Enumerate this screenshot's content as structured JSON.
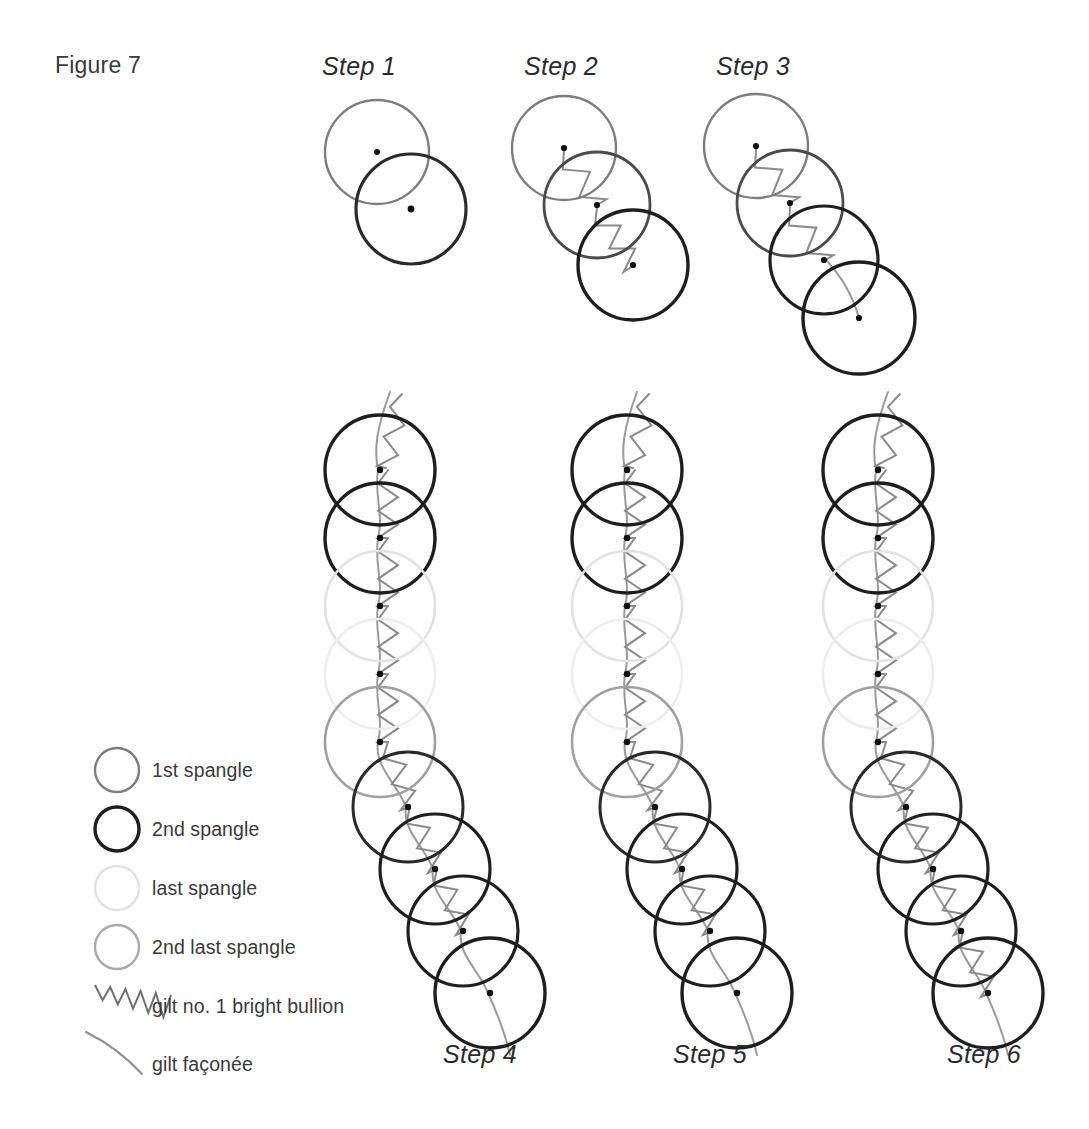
{
  "figure": {
    "title": "Figure 7",
    "title_x": 55,
    "title_y": 52
  },
  "palette": {
    "first_spangle": "#7d7d7d",
    "second_spangle": "#1e1e1e",
    "last_spangle": "#e2e2e2",
    "second_last_spangle": "#a9a9a9",
    "bullion_thread": "#8a8a8a",
    "faconee_thread": "#9a9a9a",
    "center_dot": "#111111",
    "text": "#3a3a3a",
    "background": "#ffffff"
  },
  "steps": [
    {
      "id": "step-1",
      "label": "Step 1",
      "label_x": 322,
      "label_y": 52,
      "label_position": "top"
    },
    {
      "id": "step-2",
      "label": "Step 2",
      "label_x": 524,
      "label_y": 52,
      "label_position": "top"
    },
    {
      "id": "step-3",
      "label": "Step 3",
      "label_x": 716,
      "label_y": 52,
      "label_position": "top"
    },
    {
      "id": "step-4",
      "label": "Step 4",
      "label_x": 443,
      "label_y": 1040,
      "label_position": "bottom"
    },
    {
      "id": "step-5",
      "label": "Step 5",
      "label_x": 673,
      "label_y": 1040,
      "label_position": "bottom"
    },
    {
      "id": "step-6",
      "label": "Step 6",
      "label_x": 947,
      "label_y": 1040,
      "label_position": "bottom"
    }
  ],
  "legend": {
    "items": [
      {
        "id": "legend-first-spangle",
        "label": "1st spangle",
        "swatch": "circle",
        "color": "#7d7d7d",
        "stroke_width": 2.4,
        "cy": 770,
        "label_x": 152,
        "label_y": 759
      },
      {
        "id": "legend-second-spangle",
        "label": "2nd spangle",
        "swatch": "circle",
        "color": "#1e1e1e",
        "stroke_width": 3.4,
        "cy": 829,
        "label_x": 152,
        "label_y": 818
      },
      {
        "id": "legend-last-spangle",
        "label": "last spangle",
        "swatch": "circle",
        "color": "#e2e2e2",
        "stroke_width": 2.4,
        "cy": 888,
        "label_x": 152,
        "label_y": 877
      },
      {
        "id": "legend-second-last-spangle",
        "label": "2nd last spangle",
        "swatch": "circle",
        "color": "#a9a9a9",
        "stroke_width": 2.4,
        "cy": 947,
        "label_x": 152,
        "label_y": 936
      },
      {
        "id": "legend-bullion",
        "label": "gilt no. 1 bright bullion",
        "swatch": "zigzag",
        "color": "#6f6f6f",
        "stroke_width": 2.0,
        "cy": 997,
        "label_x": 152,
        "label_y": 995
      },
      {
        "id": "legend-faconee",
        "label": "gilt façonée",
        "swatch": "arc",
        "color": "#8f8f8f",
        "stroke_width": 2.0,
        "cy": 1054,
        "label_x": 152,
        "label_y": 1053
      }
    ],
    "swatch_cx": 117,
    "swatch_r": 22
  },
  "diagram_data": {
    "type": "diagram",
    "description": "Six-step embroidery sequence showing spangles (circles) joined by gilt no. 1 bright bullion (zigzag) and gilt façonée (smooth curve).",
    "spangle_radius_top": 53,
    "spangle_radius_column": 55,
    "step_1": {
      "spangles": [
        {
          "cx": 377,
          "cy": 152,
          "r": 52,
          "type": "first",
          "color": "#7d7d7d",
          "stroke_width": 2.4
        },
        {
          "cx": 411,
          "cy": 209,
          "r": 55,
          "type": "second",
          "color": "#2a2a2a",
          "stroke_width": 3.2
        }
      ],
      "bullion_segments": [],
      "faconee_paths": []
    },
    "step_2": {
      "spangles": [
        {
          "cx": 564,
          "cy": 148,
          "r": 52,
          "type": "first",
          "color": "#7d7d7d",
          "stroke_width": 2.4
        },
        {
          "cx": 597,
          "cy": 205,
          "r": 53,
          "type": "mid",
          "color": "#4a4a4a",
          "stroke_width": 2.8
        },
        {
          "cx": 633,
          "cy": 265,
          "r": 55,
          "type": "second",
          "color": "#1e1e1e",
          "stroke_width": 3.4
        }
      ],
      "bullion_segments": [
        {
          "x1": 564,
          "y1": 150,
          "x2": 597,
          "y2": 205
        },
        {
          "x1": 597,
          "y1": 208,
          "x2": 633,
          "y2": 266
        }
      ],
      "faconee_paths": []
    },
    "step_3": {
      "spangles": [
        {
          "cx": 756,
          "cy": 146,
          "r": 52,
          "type": "first",
          "color": "#7d7d7d",
          "stroke_width": 2.4
        },
        {
          "cx": 790,
          "cy": 203,
          "r": 53,
          "type": "mid",
          "color": "#4a4a4a",
          "stroke_width": 2.8
        },
        {
          "cx": 824,
          "cy": 260,
          "r": 54,
          "type": "second",
          "color": "#1e1e1e",
          "stroke_width": 3.2
        },
        {
          "cx": 859,
          "cy": 318,
          "r": 56,
          "type": "second",
          "color": "#1e1e1e",
          "stroke_width": 3.4
        }
      ],
      "bullion_segments": [
        {
          "x1": 756,
          "y1": 148,
          "x2": 790,
          "y2": 203
        },
        {
          "x1": 790,
          "y1": 206,
          "x2": 824,
          "y2": 261
        }
      ],
      "faconee_paths": [
        {
          "x1": 824,
          "y1": 258,
          "x2": 859,
          "y2": 318
        }
      ]
    },
    "column_step_4": {
      "origin_x": 380,
      "bullion_end_index": 8
    },
    "column_step_5": {
      "origin_x": 627,
      "bullion_end_index": 8
    },
    "column_step_6": {
      "origin_x": 878,
      "bullion_end_index": 9
    },
    "column_spangles": [
      {
        "dx": 0,
        "dy": 0,
        "type": "second",
        "color": "#1e1e1e",
        "stroke_width": 3.4
      },
      {
        "dx": 0,
        "dy": 68,
        "type": "second",
        "color": "#1e1e1e",
        "stroke_width": 3.4
      },
      {
        "dx": 0,
        "dy": 136,
        "type": "last",
        "color": "#e2e2e2",
        "stroke_width": 2.6
      },
      {
        "dx": 0,
        "dy": 204,
        "type": "last",
        "color": "#ededed",
        "stroke_width": 2.6
      },
      {
        "dx": 0,
        "dy": 272,
        "type": "second_last",
        "color": "#a0a0a0",
        "stroke_width": 2.6
      },
      {
        "dx": 28,
        "dy": 337,
        "type": "second",
        "color": "#2a2a2a",
        "stroke_width": 3.0
      },
      {
        "dx": 55,
        "dy": 399,
        "type": "second",
        "color": "#1e1e1e",
        "stroke_width": 3.2
      },
      {
        "dx": 83,
        "dy": 461,
        "type": "second",
        "color": "#1e1e1e",
        "stroke_width": 3.2
      },
      {
        "dx": 110,
        "dy": 523,
        "type": "second",
        "color": "#1e1e1e",
        "stroke_width": 3.4
      }
    ]
  }
}
